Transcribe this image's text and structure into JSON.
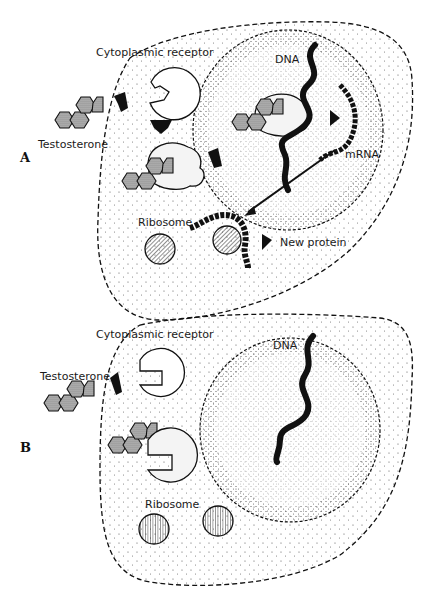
{
  "panels": [
    {
      "id": "A",
      "label": "A",
      "labels": {
        "cytoplasmic_receptor": "Cytoplasmic receptor",
        "testosterone": "Testosterone",
        "dna": "DNA",
        "mrna": "mRNA",
        "ribosome": "Ribosome",
        "new_protein": "New protein"
      }
    },
    {
      "id": "B",
      "label": "B",
      "labels": {
        "cytoplasmic_receptor": "Cytoplasmic receptor",
        "testosterone": "Testosterone",
        "dna": "DNA",
        "ribosome": "Ribosome"
      }
    }
  ],
  "colors": {
    "ink": "#111111",
    "hormone_fill": "#8a8a8a",
    "receptor_fill": "#f4f4f4",
    "background": "#ffffff"
  }
}
